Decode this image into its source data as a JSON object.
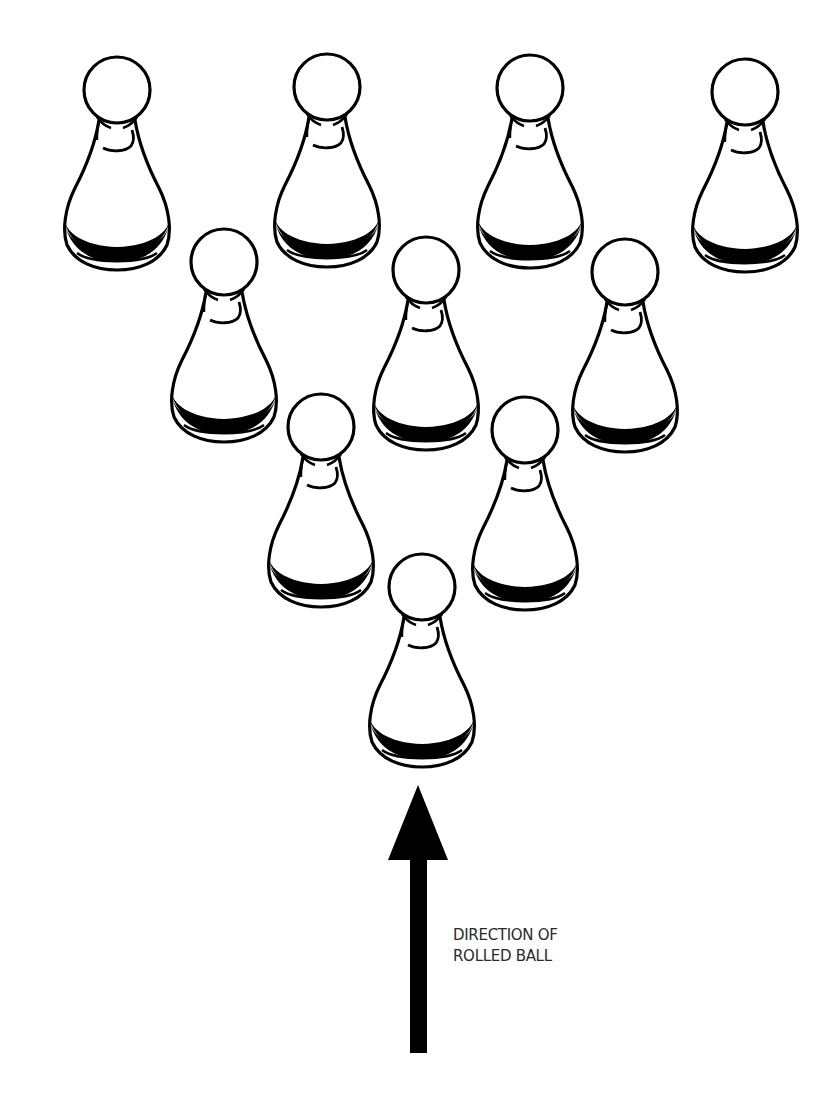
{
  "diagram": {
    "pin_count": 10,
    "colors": {
      "outline": "#000000",
      "fill": "#ffffff",
      "text": "#2a2a2a",
      "background": "#ffffff"
    },
    "pins": [
      {
        "id": 1,
        "row": 1,
        "x": 117,
        "y": 90
      },
      {
        "id": 2,
        "row": 1,
        "x": 327,
        "y": 87
      },
      {
        "id": 3,
        "row": 1,
        "x": 530,
        "y": 88
      },
      {
        "id": 4,
        "row": 1,
        "x": 745,
        "y": 92
      },
      {
        "id": 5,
        "row": 2,
        "x": 224,
        "y": 262
      },
      {
        "id": 6,
        "row": 2,
        "x": 426,
        "y": 270
      },
      {
        "id": 7,
        "row": 2,
        "x": 625,
        "y": 272
      },
      {
        "id": 8,
        "row": 3,
        "x": 321,
        "y": 427
      },
      {
        "id": 9,
        "row": 3,
        "x": 525,
        "y": 430
      },
      {
        "id": 10,
        "row": 4,
        "x": 422,
        "y": 587
      }
    ],
    "arrow": {
      "direction": "up",
      "head_tip": {
        "x": 418,
        "y": 785
      },
      "head_base_y": 860,
      "head_half_width": 30,
      "shaft_x": 410,
      "shaft_width": 17,
      "shaft_bottom_y": 1053
    },
    "label": {
      "line1": "DIRECTION OF",
      "line2": "ROLLED BALL",
      "x": 453,
      "y": 925
    }
  }
}
